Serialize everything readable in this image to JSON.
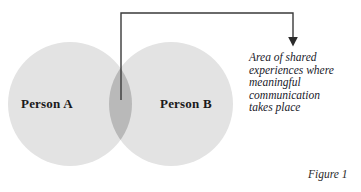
{
  "figure": {
    "type": "venn-diagram",
    "caption": "Figure 1",
    "background_color": "#ffffff"
  },
  "venn": {
    "circle_fill_color": "#e3e3e3",
    "overlap_fill_color": "#b9b9b9",
    "left_circle": {
      "label": "Person A",
      "cx": 70,
      "cy": 104,
      "r": 62
    },
    "right_circle": {
      "label": "Person B",
      "cx": 171,
      "cy": 104,
      "r": 62
    }
  },
  "leader": {
    "line_color": "#3a3a3a",
    "arrow_color": "#2b2b2b",
    "start_x": 121,
    "start_y": 100,
    "top_y": 13,
    "end_x": 293,
    "arrow_tip_y": 46
  },
  "annotation": {
    "lines": [
      "Area of shared",
      "experiences where",
      "meaningful",
      "communication",
      "takes place"
    ],
    "line_0": "Area of shared",
    "line_1": "experiences where",
    "line_2": "meaningful",
    "line_3": "communication",
    "line_4": "takes place"
  }
}
